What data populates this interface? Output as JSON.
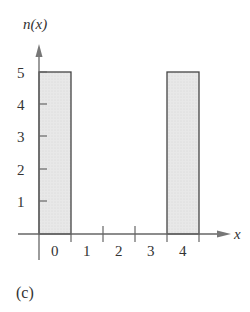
{
  "chart_data": {
    "type": "bar",
    "title": "",
    "xlabel": "x",
    "ylabel": "n(x)",
    "categories": [
      "0",
      "1",
      "2",
      "3",
      "4"
    ],
    "values": [
      5,
      0,
      0,
      0,
      5
    ],
    "xticks": [
      "0",
      "1",
      "2",
      "3",
      "4"
    ],
    "yticks": [
      "1",
      "2",
      "3",
      "4",
      "5"
    ],
    "ylim": [
      0,
      5
    ],
    "grid": false,
    "legend": null,
    "bar_fill": "#e6e6e6",
    "bar_stroke": "#444444",
    "axis_color": "#666666"
  },
  "figure": {
    "caption": "(c)",
    "y_axis_label": "n(x)",
    "x_axis_label": "x"
  }
}
